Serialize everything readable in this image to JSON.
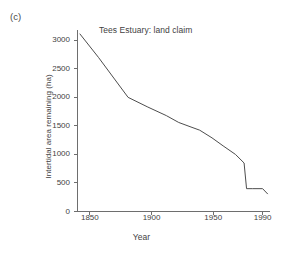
{
  "figure": {
    "panel_label": "(c)",
    "background_color": "#ffffff",
    "line_color": "#4d4d4d",
    "axis_color": "#6e6e6e",
    "text_color": "#3f3f3f"
  },
  "chart_data": {
    "type": "line",
    "title": "Tees Estuary: land claim",
    "xlabel": "Year",
    "ylabel": "Intertidal area remaining (ha)",
    "xlim": [
      1840,
      1996
    ],
    "ylim": [
      0,
      3180
    ],
    "grid": false,
    "legend": null,
    "xticks": [
      1850,
      1900,
      1950,
      1990
    ],
    "xtick_labels": [
      "1850",
      "1900",
      "1950",
      "1990"
    ],
    "yticks": [
      0,
      500,
      1000,
      1500,
      2000,
      2500,
      3000
    ],
    "ytick_labels": [
      "0",
      "500",
      "1000",
      "1500",
      "2000",
      "2500",
      "3000"
    ],
    "series": [
      {
        "name": "Intertidal area remaining",
        "x": [
          1842,
          1857,
          1881,
          1897,
          1912,
          1922,
          1932,
          1939,
          1949,
          1958,
          1968,
          1975,
          1977,
          1982,
          1990,
          1994
        ],
        "y": [
          3110,
          2700,
          2000,
          1830,
          1680,
          1560,
          1480,
          1425,
          1290,
          1150,
          1000,
          850,
          400,
          400,
          400,
          310
        ]
      }
    ]
  }
}
